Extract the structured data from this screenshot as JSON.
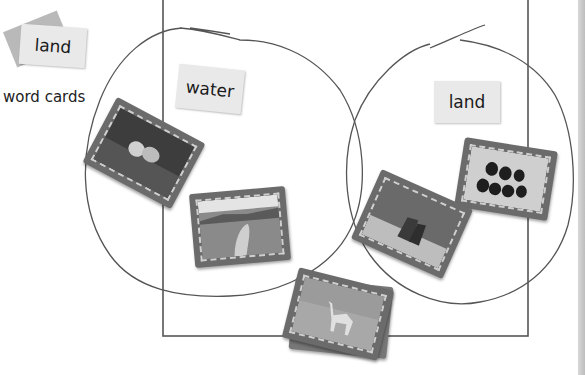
{
  "legend": {
    "word_card_sample": "land",
    "caption": "word cards"
  },
  "diagram": {
    "type": "Venn diagram sorting animal photo cards",
    "circles": [
      {
        "label": "water",
        "contents": [
          "fish",
          "whale"
        ]
      },
      {
        "label": "land",
        "contents": [
          "deer",
          "snake"
        ]
      }
    ],
    "unsorted_pile": [
      "camel"
    ],
    "colors": {
      "line": "#555555",
      "word_card": "#e9e9e9",
      "photo_frame": "#6b6b6b"
    }
  },
  "photos": {
    "fish": "fish-photo",
    "whale": "whale-photo",
    "deer": "deer-photo",
    "snake": "snake-photo",
    "camel": "camel-photo"
  }
}
